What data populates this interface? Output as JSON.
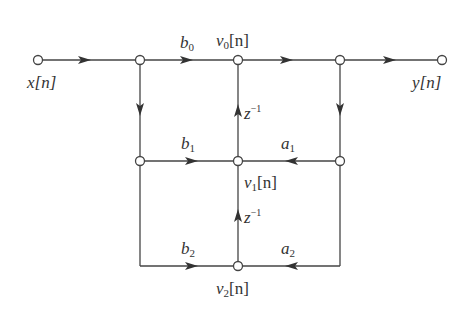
{
  "diagram": {
    "type": "signal-flow-graph",
    "input_label": "x[n]",
    "output_label": "y[n]",
    "node_labels": {
      "v0": {
        "base": "v",
        "sub": "0",
        "arg": "[n]"
      },
      "v1": {
        "base": "v",
        "sub": "1",
        "arg": "[n]"
      },
      "v2": {
        "base": "v",
        "sub": "2",
        "arg": "[n]"
      }
    },
    "gains": {
      "b0": {
        "base": "b",
        "sub": "0"
      },
      "b1": {
        "base": "b",
        "sub": "1"
      },
      "b2": {
        "base": "b",
        "sub": "2"
      },
      "a1": {
        "base": "a",
        "sub": "1"
      },
      "a2": {
        "base": "a",
        "sub": "2"
      }
    },
    "delays": [
      {
        "base": "z",
        "sup": "−1"
      },
      {
        "base": "z",
        "sup": "−1"
      }
    ],
    "colors": {
      "line": "#444444",
      "node_fill": "#ffffff"
    }
  }
}
